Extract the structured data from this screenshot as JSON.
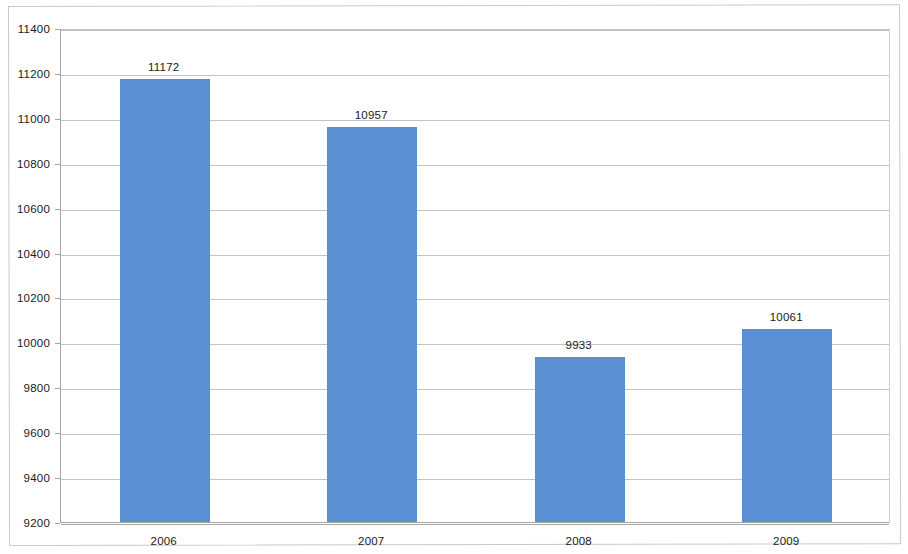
{
  "chart_data": {
    "type": "bar",
    "title": "",
    "subtitle": "",
    "xlabel": "",
    "ylabel": "",
    "categories": [
      "2006",
      "2007",
      "2008",
      "2009"
    ],
    "values": [
      11172,
      10957,
      9933,
      10061
    ],
    "data_labels": [
      "11172",
      "10957",
      "9933",
      "10061"
    ],
    "series": [
      {
        "name": "",
        "values": [
          11172,
          10957,
          9933,
          10061
        ],
        "color": "#5B8FD4"
      }
    ],
    "ylim": [
      9200,
      11400
    ],
    "y_tick_step": 200,
    "y_tick_labels": [
      "11400",
      "11200",
      "11000",
      "10800",
      "10600",
      "10400",
      "10200",
      "10000",
      "9800",
      "9600",
      "9400",
      "9200"
    ],
    "y_tick_values": [
      11400,
      11200,
      11000,
      10800,
      10600,
      10400,
      10200,
      10000,
      9800,
      9600,
      9400,
      9200
    ],
    "grid": true,
    "grid_axis": "y",
    "legend": false,
    "legend_position": "none",
    "bar_color": "#5B8FD4",
    "gridline_color": "#C4C4C4",
    "axis_color": "#A6A6A6",
    "background_color": "#FFFFFF",
    "text_color": "#1A1A1A"
  }
}
